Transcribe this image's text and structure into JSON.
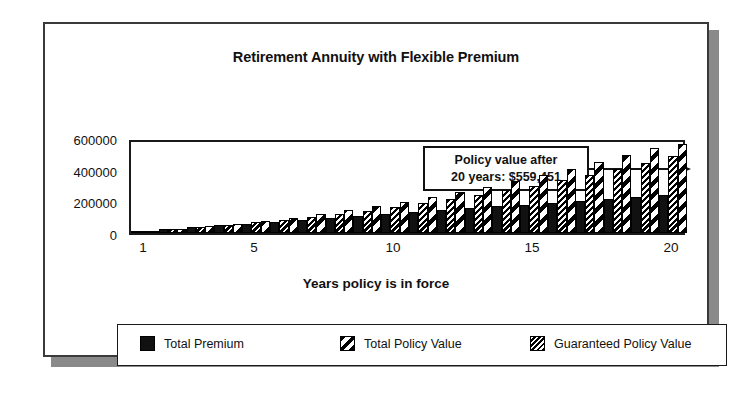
{
  "figure": {
    "title": "Retirement Annuity with Flexible Premium"
  },
  "callout": {
    "line1": "Policy value after",
    "line2": "20 years:  $559,451"
  },
  "legend": {
    "entries": [
      {
        "label": "Total Premium",
        "pattern": "solid-black"
      },
      {
        "label": "Total Policy Value",
        "pattern": "coarse-diagonal-hatch"
      },
      {
        "label": "Guaranteed Policy Value",
        "pattern": "dense-diagonal-hatch"
      }
    ]
  },
  "chart_data": {
    "type": "bar",
    "title": "Retirement Annuity with Flexible Premium",
    "xlabel": "Years policy is in force",
    "ylabel": "",
    "ylim": [
      0,
      600000
    ],
    "yticks": [
      0,
      200000,
      400000,
      600000
    ],
    "ytick_labels": [
      "0",
      "200000",
      "400000",
      "600000"
    ],
    "xticks": [
      1,
      5,
      10,
      15,
      20
    ],
    "xtick_labels": [
      "1",
      "5",
      "10",
      "15",
      "20"
    ],
    "grid": false,
    "legend_position": "below-axis",
    "annotation": "Policy value after 20 years:  $559,451",
    "categories": [
      1,
      2,
      3,
      4,
      5,
      6,
      7,
      8,
      9,
      10,
      11,
      12,
      13,
      14,
      15,
      16,
      17,
      18,
      19,
      20
    ],
    "series": [
      {
        "name": "Total Premium",
        "pattern": "solid-black",
        "values": [
          12000,
          24000,
          36000,
          48000,
          60000,
          72000,
          84000,
          96000,
          108000,
          120000,
          132000,
          144000,
          156000,
          168000,
          180000,
          192000,
          204000,
          216000,
          228000,
          240000
        ]
      },
      {
        "name": "Guaranteed Policy Value",
        "pattern": "dense-diagonal-hatch",
        "values": [
          10500,
          23000,
          36500,
          51000,
          67000,
          84000,
          102000,
          121000,
          142000,
          164000,
          188000,
          213000,
          240000,
          269000,
          300000,
          333000,
          368000,
          405000,
          445000,
          487000
        ]
      },
      {
        "name": "Total Policy Value",
        "pattern": "coarse-diagonal-hatch",
        "values": [
          12500,
          26500,
          42000,
          59000,
          77500,
          97500,
          119000,
          142500,
          168000,
          195500,
          225000,
          256500,
          290000,
          326000,
          364000,
          404500,
          447000,
          492000,
          540000,
          559451
        ]
      }
    ]
  }
}
